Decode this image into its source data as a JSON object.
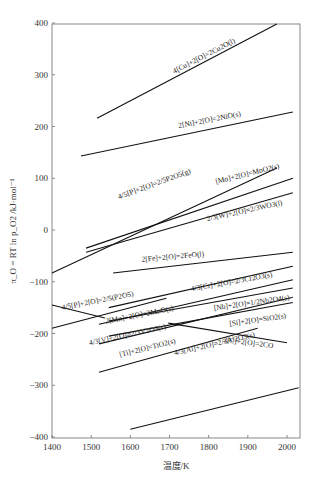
{
  "chart_data": {
    "type": "line",
    "title": "",
    "xlabel": "温度/K",
    "ylabel": "π_O = RT ln p_O2 /kJ·mol⁻¹",
    "xlim": [
      1400,
      2030
    ],
    "ylim": [
      -400,
      400
    ],
    "xticks": [
      1400,
      1500,
      1600,
      1700,
      1800,
      1900,
      2000
    ],
    "yticks": [
      -400,
      -300,
      -200,
      -100,
      0,
      100,
      200,
      300,
      400
    ],
    "grid": false,
    "legend": "inline labels",
    "series": [
      {
        "name": "4[Cu]+2[O]=2Cu2O(l)",
        "x": [
          1515,
          1974
        ],
        "y": [
          216,
          398
        ],
        "label_pos": [
          205,
          58
        ],
        "label_angle": -27
      },
      {
        "name": "2[Ni]+2[O]=2NiO(s)",
        "x": [
          1474,
          2015
        ],
        "y": [
          143,
          228
        ],
        "label_pos": [
          210,
          122
        ],
        "label_angle": -11
      },
      {
        "name": "4/5[P]+2[O]=2/5P2O5(g)",
        "x": [
          1400,
          1974
        ],
        "y": [
          -83,
          120
        ],
        "label_pos": [
          155,
          186
        ],
        "label_angle": -20
      },
      {
        "name": "[Mo]+2[O]=MoO2(s)",
        "x": [
          1487,
          2015
        ],
        "y": [
          -35,
          100
        ],
        "label_pos": [
          248,
          176
        ],
        "label_angle": -14
      },
      {
        "name": "2/3[W]+2[O]=2/3WO3(l)",
        "x": [
          1487,
          2015
        ],
        "y": [
          -43,
          72
        ],
        "label_pos": [
          245,
          213
        ],
        "label_angle": -12
      },
      {
        "name": "2[Fe]+2[O]=2FeO(l)",
        "x": [
          1556,
          2015
        ],
        "y": [
          -83,
          -43
        ],
        "label_pos": [
          173,
          259
        ],
        "label_angle": -5
      },
      {
        "name": "4/3[Cr]+2[O]=2/3Cr2O3(s)",
        "x": [
          1545,
          2015
        ],
        "y": [
          -150,
          -70
        ],
        "label_pos": [
          232,
          284
        ],
        "label_angle": -10
      },
      {
        "name": "4/5[P]+2[O]=2/5(P2O5)",
        "x": [
          1400,
          1692
        ],
        "y": [
          -190,
          -132
        ],
        "label_pos": [
          98,
          303
        ],
        "label_angle": -11
      },
      {
        "name": "4/5[P]+2[O]=2/5(P2O5) (descending)",
        "x": [
          1400,
          1535
        ],
        "y": [
          -145,
          -170
        ]
      },
      {
        "name": "2[Mn]+2[O]=2MnO(s)",
        "x": [
          1520,
          2015
        ],
        "y": [
          -182,
          -96
        ],
        "label_pos": [
          140,
          317
        ],
        "label_angle": -11
      },
      {
        "name": "[Nb]+2[O]=1/2Nb2O4(s)",
        "x": [
          1545,
          2015
        ],
        "y": [
          -176,
          -112
        ],
        "label_pos": [
          252,
          305
        ],
        "label_angle": -8
      },
      {
        "name": "4/3[V]+2[O]=2/3V2O3(s)",
        "x": [
          1520,
          2015
        ],
        "y": [
          -220,
          -130
        ],
        "label_pos": [
          128,
          337
        ],
        "label_angle": -12
      },
      {
        "name": "[Si]+2[O]=SiO2(s)",
        "x": [
          1545,
          2015
        ],
        "y": [
          -205,
          -140
        ],
        "label_pos": [
          258,
          322
        ],
        "label_angle": -8
      },
      {
        "name": "[Ti]+2[O]=TiO2(s)",
        "x": [
          1520,
          1925
        ],
        "y": [
          -275,
          -190
        ],
        "label_pos": [
          148,
          350
        ],
        "label_angle": -14
      },
      {
        "name": "2[C]+2[O]=2CO",
        "x": [
          1697,
          2000
        ],
        "y": [
          -180,
          -218
        ],
        "label_pos": [
          248,
          345
        ],
        "label_angle": 7
      },
      {
        "name": "4/3[Al]+2[O]=2/3Al2O3(s)",
        "x": [
          1600,
          2030
        ],
        "y": [
          -385,
          -305
        ],
        "label_pos": [
          215,
          346
        ],
        "label_angle": -13
      }
    ]
  }
}
